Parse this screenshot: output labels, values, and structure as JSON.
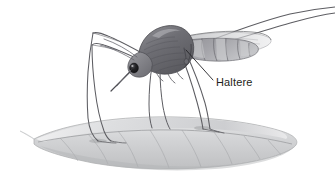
{
  "figure": {
    "kind": "scientific-illustration",
    "style": "grayscale-pencil-stipple",
    "background_color": "#ffffff",
    "width": 335,
    "height": 184
  },
  "annotations": [
    {
      "id": "haltere",
      "label": "Haltere",
      "text_color": "#1e1e20",
      "font_size": 11,
      "text_x": 216,
      "text_y": 86,
      "leader_line": {
        "from_x": 186,
        "from_y": 50,
        "to_x": 213,
        "to_y": 80,
        "color": "#232326",
        "width": 0.9
      }
    }
  ],
  "palette": {
    "body_dark": "#4a4a4e",
    "body_mid": "#77777c",
    "body_light": "#a9a9ae",
    "leg_line": "#5d5d62",
    "leaf_light": "#d8d9da",
    "leaf_mid": "#bcbdbf",
    "leaf_vein": "#96979a",
    "eye_dark": "#1a1a1c",
    "wing_light": "#c8c9cb",
    "outline": "#3a3a3d"
  },
  "parts": {
    "head": "head",
    "eye": "compound-eye",
    "proboscis": "proboscis",
    "thorax": "thorax",
    "abdomen": "abdomen",
    "wing": "wing",
    "haltere": "haltere",
    "front_legs": "front-legs",
    "middle_legs": "middle-legs",
    "hind_legs": "hind-legs",
    "leaf": "leaf",
    "leaf_midrib": "leaf-midrib",
    "leaf_veins": "leaf-veins"
  }
}
